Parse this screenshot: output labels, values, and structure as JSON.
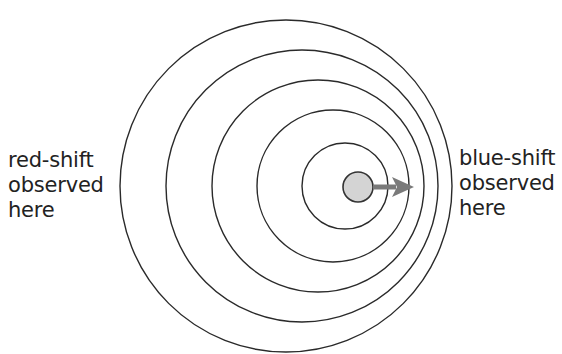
{
  "diagram": {
    "type": "doppler-effect",
    "colors": {
      "background": "#ffffff",
      "wavefront": "#2a2a2a",
      "source_fill": "#d4d4d4",
      "source_stroke": "#333333",
      "arrow": "#7a7a7a",
      "text": "#222222"
    },
    "wavefronts": [
      {
        "cx": 286,
        "cy": 186,
        "r": 166
      },
      {
        "cx": 302,
        "cy": 186,
        "r": 136
      },
      {
        "cx": 318,
        "cy": 186,
        "r": 106
      },
      {
        "cx": 333,
        "cy": 186,
        "r": 76
      },
      {
        "cx": 345,
        "cy": 186,
        "r": 43
      }
    ],
    "source": {
      "cx": 358,
      "cy": 187,
      "r": 15
    },
    "arrow": {
      "x1": 373,
      "y1": 187,
      "x2": 414,
      "y2": 187,
      "direction": "right"
    },
    "left_label": {
      "lines": [
        "red-shift",
        "observed",
        "here"
      ]
    },
    "right_label": {
      "lines": [
        "blue-shift",
        "observed",
        "here"
      ]
    }
  }
}
